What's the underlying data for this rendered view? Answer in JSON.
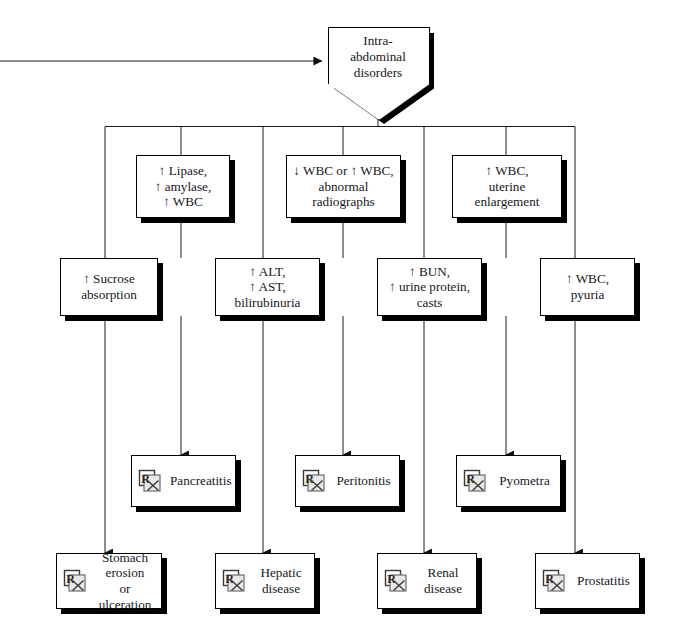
{
  "diagram": {
    "root": {
      "label": "Intra-\nabdominal\ndisorders",
      "name": "root-node-intra-abdominal-disorders"
    },
    "findings_row1": [
      {
        "name": "finding-lipase-amylase-wbc",
        "label": "↑ Lipase,\n↑ amylase,\n↑ WBC"
      },
      {
        "name": "finding-wbc-abnormal-radiographs",
        "label": "↓ WBC or ↑ WBC,\nabnormal\nradiographs"
      },
      {
        "name": "finding-wbc-uterine-enlargement",
        "label": "↑ WBC,\nuterine\nenlargement"
      }
    ],
    "findings_row2": [
      {
        "name": "finding-sucrose-absorption",
        "label": "↑ Sucrose\nabsorption"
      },
      {
        "name": "finding-alt-ast-bilirubinuria",
        "label": "↑ ALT,\n↑ AST,\nbilirubinuria"
      },
      {
        "name": "finding-bun-urine-protein-casts",
        "label": "↑ BUN,\n↑ urine protein,\ncasts"
      },
      {
        "name": "finding-wbc-pyuria",
        "label": "↑ WBC,\npyuria"
      }
    ],
    "diagnoses_row3": [
      {
        "name": "diagnosis-pancreatitis",
        "label": "Pancreatitis",
        "icon": "rx-prescription-icon"
      },
      {
        "name": "diagnosis-peritonitis",
        "label": "Peritonitis",
        "icon": "rx-prescription-icon"
      },
      {
        "name": "diagnosis-pyometra",
        "label": "Pyometra",
        "icon": "rx-prescription-icon"
      }
    ],
    "diagnoses_row4": [
      {
        "name": "diagnosis-stomach-erosion-or-ulceration",
        "label": "Stomach\nerosion\nor ulceration",
        "icon": "rx-prescription-icon"
      },
      {
        "name": "diagnosis-hepatic-disease",
        "label": "Hepatic\ndisease",
        "icon": "rx-prescription-icon"
      },
      {
        "name": "diagnosis-renal-disease",
        "label": "Renal\ndisease",
        "icon": "rx-prescription-icon"
      },
      {
        "name": "diagnosis-prostatitis",
        "label": "Prostatitis",
        "icon": "rx-prescription-icon"
      }
    ],
    "colors": {
      "line": "#1a1a1a",
      "box_fill": "#ffffff",
      "shadow": "#000000",
      "text": "#17171a"
    }
  }
}
